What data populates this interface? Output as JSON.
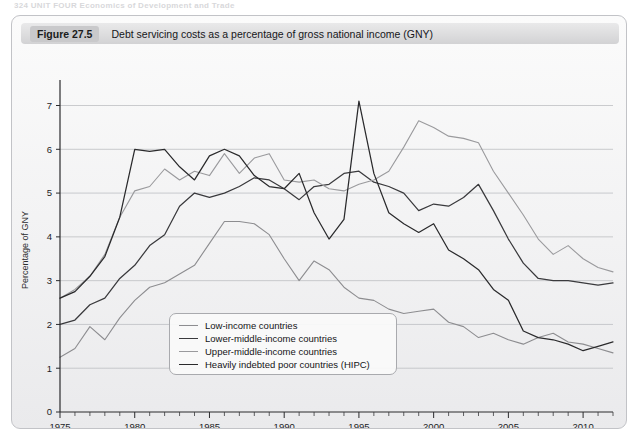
{
  "running_header": "324   UNIT FOUR   Economics of Development and Trade",
  "figure": {
    "number": "Figure 27.5",
    "title": "Debt servicing costs as a percentage of gross national income (GNY)"
  },
  "colors": {
    "low_income": "#8d8d90",
    "lower_middle": "#3a3a3d",
    "upper_middle": "#9a9a9d",
    "hipc": "#2a2a2c",
    "gridline": "#b6b7bb",
    "axis": "#2b2b2d",
    "panel_background": "#f4f4f5",
    "caption_bar": "#dededf"
  },
  "legend": {
    "position": "inside-bottom-left",
    "items": [
      {
        "label": "Low-income countries",
        "color": "#8d8d90"
      },
      {
        "label": "Lower-middle-income countries",
        "color": "#3a3a3d"
      },
      {
        "label": "Upper-middle-income countries",
        "color": "#9a9a9d"
      },
      {
        "label": "Heavily indebted poor countries (HIPC)",
        "color": "#2a2a2c"
      }
    ]
  },
  "chart_data": {
    "type": "line",
    "title": "Debt servicing costs as a percentage of gross national income (GNY)",
    "xlabel": "",
    "ylabel": "Percentage of GNY",
    "xlim": [
      1975,
      2012
    ],
    "ylim": [
      0,
      7.4
    ],
    "yticks": [
      0,
      1,
      2,
      3,
      4,
      5,
      6,
      7
    ],
    "xticks": [
      1975,
      1980,
      1985,
      1990,
      1995,
      2000,
      2005,
      2010
    ],
    "x_minor_tick_interval": 1,
    "grid": "horizontal",
    "x": [
      1975,
      1976,
      1977,
      1978,
      1979,
      1980,
      1981,
      1982,
      1983,
      1984,
      1985,
      1986,
      1987,
      1988,
      1989,
      1990,
      1991,
      1992,
      1993,
      1994,
      1995,
      1996,
      1997,
      1998,
      1999,
      2000,
      2001,
      2002,
      2003,
      2004,
      2005,
      2006,
      2007,
      2008,
      2009,
      2010,
      2011,
      2012
    ],
    "series": [
      {
        "name": "Low-income countries",
        "color": "#8d8d90",
        "values": [
          1.25,
          1.45,
          1.95,
          1.65,
          2.15,
          2.55,
          2.85,
          2.95,
          3.15,
          3.35,
          3.85,
          4.35,
          4.35,
          4.3,
          4.05,
          3.5,
          3.0,
          3.45,
          3.25,
          2.85,
          2.6,
          2.55,
          2.35,
          2.25,
          2.3,
          2.35,
          2.05,
          1.95,
          1.7,
          1.8,
          1.65,
          1.55,
          1.7,
          1.8,
          1.6,
          1.55,
          1.45,
          1.35
        ]
      },
      {
        "name": "Lower-middle-income countries",
        "color": "#3a3a3d",
        "values": [
          2.0,
          2.1,
          2.45,
          2.6,
          3.05,
          3.35,
          3.8,
          4.05,
          4.7,
          5.0,
          4.9,
          5.0,
          5.15,
          5.35,
          5.3,
          5.1,
          4.85,
          5.15,
          5.2,
          5.45,
          5.5,
          5.25,
          5.15,
          5.0,
          4.6,
          4.75,
          4.7,
          4.9,
          5.2,
          4.6,
          3.95,
          3.4,
          3.05,
          3.0,
          3.0,
          2.95,
          2.9,
          2.95
        ]
      },
      {
        "name": "Upper-middle-income countries",
        "color": "#9a9a9d",
        "values": [
          2.6,
          2.8,
          3.1,
          3.6,
          4.45,
          5.05,
          5.15,
          5.55,
          5.3,
          5.5,
          5.4,
          5.9,
          5.45,
          5.8,
          5.9,
          5.3,
          5.25,
          5.3,
          5.1,
          5.05,
          5.2,
          5.3,
          5.5,
          6.05,
          6.65,
          6.5,
          6.3,
          6.25,
          6.15,
          5.5,
          5.0,
          4.5,
          3.95,
          3.6,
          3.8,
          3.5,
          3.3,
          3.2
        ]
      },
      {
        "name": "Heavily indebted poor countries (HIPC)",
        "color": "#2a2a2c",
        "values": [
          2.6,
          2.75,
          3.1,
          3.55,
          4.45,
          6.0,
          5.95,
          6.0,
          5.6,
          5.3,
          5.85,
          6.0,
          5.85,
          5.4,
          5.15,
          5.1,
          5.45,
          4.55,
          3.95,
          4.4,
          7.1,
          5.45,
          4.55,
          4.3,
          4.1,
          4.3,
          3.7,
          3.5,
          3.25,
          2.8,
          2.55,
          1.85,
          1.7,
          1.65,
          1.55,
          1.4,
          1.5,
          1.6
        ]
      }
    ]
  }
}
